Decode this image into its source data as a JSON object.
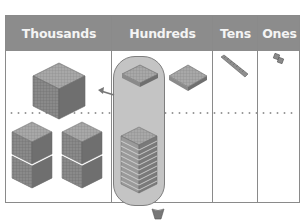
{
  "place_value_chart": {
    "columns": [
      {
        "label": "Thousands"
      },
      {
        "label": "Hundreds"
      },
      {
        "label": "Tens"
      },
      {
        "label": "Ones"
      }
    ],
    "top_row": {
      "thousands": "1 thousand cube",
      "hundreds": "2 hundred flats",
      "tens": "1 ten rod",
      "ones": "2 ones"
    },
    "bottom_row": {
      "thousands": "4 thousand cubes",
      "hundreds": "10 hundred flats (stacked)",
      "tens": "",
      "ones": ""
    },
    "exchange_arrow": "10 hundreds exchanged for 1 thousand",
    "colors": {
      "header": "#8c8c8c",
      "header_text": "#f4f4f4",
      "highlight": "#c4c4c4",
      "block": "#7a7a7a",
      "border": "#8a8a8a"
    }
  }
}
